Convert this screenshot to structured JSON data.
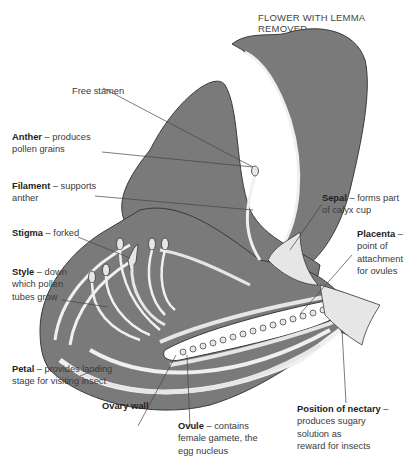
{
  "title": "FLOWER WITH LEMMA REMOVED",
  "colors": {
    "tissue_dark": "#7a7a7a",
    "tissue_light": "#e6e6e6",
    "outline": "#3a3a3a",
    "leader_line": "#444444",
    "background": "#ffffff"
  },
  "labels": {
    "free_stamen": {
      "term": "Free stamen",
      "desc": ""
    },
    "anther": {
      "term": "Anther",
      "desc": "– produces",
      "desc2": "pollen grains"
    },
    "filament": {
      "term": "Filament",
      "desc": "– supports",
      "desc2": "anther"
    },
    "stigma": {
      "term": "Stigma",
      "desc": "– forked"
    },
    "style": {
      "term": "Style",
      "desc": "– down",
      "desc2": "which pollen",
      "desc3": "tubes grow"
    },
    "petal": {
      "term": "Petal",
      "desc": "– provides landing",
      "desc2": "stage for visiting insect"
    },
    "ovary_wall": {
      "term": "Ovary wall"
    },
    "ovule": {
      "term": "Ovule",
      "desc": "– contains",
      "desc2": "female gamete, the",
      "desc3": "egg nucleus"
    },
    "sepal": {
      "term": "Sepal",
      "desc": "– forms part",
      "desc2": "of calyx cup"
    },
    "placenta": {
      "term": "Placenta",
      "desc": "–",
      "desc2": "point of",
      "desc3": "attachment",
      "desc4": "for ovules"
    },
    "nectary": {
      "term": "Position of nectary",
      "desc": "–",
      "desc2": "produces sugary",
      "desc3": "solution as",
      "desc4": "reward for insects"
    }
  }
}
